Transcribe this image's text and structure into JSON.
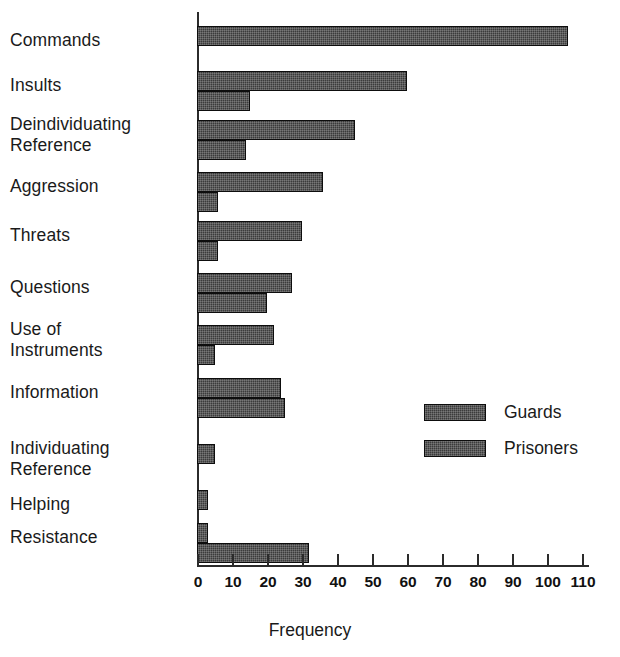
{
  "chart_data": {
    "type": "bar",
    "orientation": "horizontal",
    "title": "",
    "xlabel": "Frequency",
    "ylabel": "",
    "xlim": [
      0,
      110
    ],
    "xticks": [
      0,
      10,
      20,
      30,
      40,
      50,
      60,
      70,
      80,
      90,
      100,
      110
    ],
    "xtick_labels": [
      "0",
      "10",
      "20",
      "30",
      "40",
      "50",
      "60",
      "70",
      "80",
      "90",
      "100",
      "110"
    ],
    "grid": false,
    "legend_position": "center-right",
    "categories": [
      "Commands",
      "Insults",
      "Deindividuating\nReference",
      "Aggression",
      "Threats",
      "Questions",
      "Use of\nInstruments",
      "Information",
      "Individuating\nReference",
      "Helping",
      "Resistance"
    ],
    "series": [
      {
        "name": "Guards",
        "color": "#3b3b3b",
        "values": [
          106,
          60,
          45,
          36,
          30,
          27,
          22,
          24,
          5,
          3,
          3
        ]
      },
      {
        "name": "Prisoners",
        "color": "#3b3b3b",
        "values": [
          0,
          15,
          14,
          6,
          6,
          20,
          5,
          25,
          0,
          0,
          32
        ]
      }
    ]
  },
  "legend": {
    "entries": [
      {
        "label": "Guards",
        "swatch": "legend-swatch-guards"
      },
      {
        "label": "Prisoners",
        "swatch": "legend-swatch-prisoners"
      }
    ]
  },
  "axis": {
    "x_title": "Frequency"
  }
}
